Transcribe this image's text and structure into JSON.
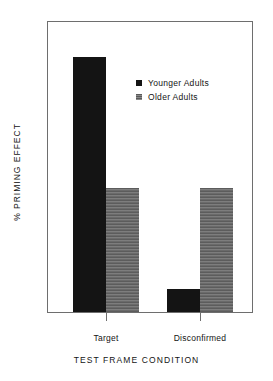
{
  "chart_data": {
    "type": "bar",
    "title": "",
    "subtitle": "",
    "xlabel": "TEST FRAME CONDITION",
    "ylabel": "% PRIMING EFFECT",
    "categories": [
      "Target",
      "Disconfirmed"
    ],
    "series": [
      {
        "name": "Younger Adults",
        "values": [
          12.3,
          1.1
        ],
        "color": "#141414"
      },
      {
        "name": "Older Adults",
        "values": [
          6.0,
          6.0
        ],
        "color": "#6b6b6b"
      }
    ],
    "ylim": [
      0,
      14
    ],
    "ytick_values": [
      0,
      2,
      4,
      6,
      8,
      10,
      12,
      14
    ],
    "ytick_labels": [
      "0",
      "2",
      "4",
      "6",
      "8",
      "10",
      "12",
      "14"
    ],
    "yminor_values": [
      1,
      3,
      5,
      7,
      9,
      11,
      13
    ],
    "grid": false,
    "legend_position": "upper-center-right",
    "frame": true,
    "annotations": []
  },
  "axes": {
    "y_title": "% PRIMING EFFECT",
    "x_title": "TEST FRAME CONDITION",
    "y_ticks": [
      {
        "label": "14",
        "value": 14
      },
      {
        "label": "12",
        "value": 12
      },
      {
        "label": "10",
        "value": 10
      },
      {
        "label": "8",
        "value": 8
      },
      {
        "label": "6",
        "value": 6
      },
      {
        "label": "4",
        "value": 4
      },
      {
        "label": "2",
        "value": 2
      },
      {
        "label": "0",
        "value": 0
      }
    ],
    "x_ticks": [
      {
        "label": "Target"
      },
      {
        "label": "Disconfirmed"
      }
    ]
  },
  "legend": {
    "entries": [
      {
        "label": "Younger Adults",
        "swatch": "black-square-marker"
      },
      {
        "label": "Older Adults",
        "swatch": "gray-square-marker"
      }
    ]
  }
}
